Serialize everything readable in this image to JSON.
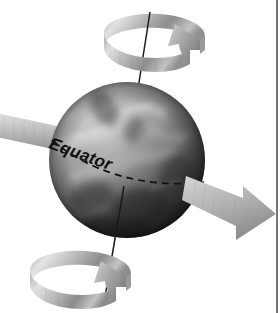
{
  "figure": {
    "background_color": "#ffffff",
    "width": 280,
    "height": 313
  },
  "labels": {
    "equator": "Equator"
  },
  "colors": {
    "globe_light": "#c9c9c9",
    "globe_mid": "#8f8f8f",
    "globe_dark": "#3a3a3a",
    "globe_shadow": "#1d1d1d",
    "ribbon_light": "#dcdcdc",
    "ribbon_mid": "#a8a8a8",
    "ribbon_dark": "#7a7a7a",
    "band_light": "#d6d6d6",
    "band_mid": "#b0b0b0",
    "axis_line": "#1a1a1a",
    "equator_line": "#111111",
    "border_rule": "#3c3c3c",
    "label_text": "#101010"
  },
  "globe": {
    "center_x": 127,
    "center_y": 160,
    "radius": 78,
    "name": "planet-sphere"
  },
  "axis": {
    "top_x": 150,
    "top_y": 12,
    "bottom_x": 104,
    "bottom_y": 303,
    "tilt_description": "top leaning right"
  },
  "equator_line": {
    "style": "dashed",
    "dash_pattern": "7 5",
    "label_rotation_deg": 20
  },
  "rotation_arrows": {
    "north_ribbon": {
      "name": "north-rotation-ribbon",
      "direction": "counterclockwise"
    },
    "south_ribbon": {
      "name": "south-rotation-ribbon",
      "direction": "counterclockwise"
    }
  },
  "equatorial_band": {
    "name": "equatorial-band-arrow",
    "direction": "left-to-right",
    "enters_at_left_edge": true,
    "exits_right_downward": true
  },
  "border": {
    "vertical_rule_x": 277
  }
}
